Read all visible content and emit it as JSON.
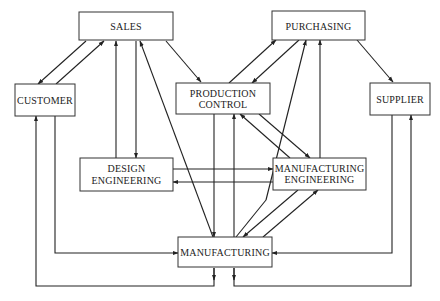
{
  "nodes": {
    "sales": {
      "lines": [
        "SALES"
      ]
    },
    "purchasing": {
      "lines": [
        "PURCHASING"
      ]
    },
    "customer": {
      "lines": [
        "CUSTOMER"
      ]
    },
    "production_control": {
      "lines": [
        "PRODUCTION",
        "CONTROL"
      ]
    },
    "supplier": {
      "lines": [
        "SUPPLIER"
      ]
    },
    "design_engineering": {
      "lines": [
        "DESIGN",
        "ENGINEERING"
      ]
    },
    "manufacturing_engineering": {
      "lines": [
        "MANUFACTURING",
        "ENGINEERING"
      ]
    },
    "manufacturing": {
      "lines": [
        "MANUFACTURING"
      ]
    }
  },
  "edges": [
    {
      "from": "SALES",
      "to": "CUSTOMER"
    },
    {
      "from": "CUSTOMER",
      "to": "SALES"
    },
    {
      "from": "SALES",
      "to": "PRODUCTION CONTROL"
    },
    {
      "from": "DESIGN ENGINEERING",
      "to": "SALES"
    },
    {
      "from": "SALES",
      "to": "DESIGN ENGINEERING"
    },
    {
      "from": "MANUFACTURING",
      "to": "SALES"
    },
    {
      "from": "PRODUCTION CONTROL",
      "to": "PURCHASING"
    },
    {
      "from": "PURCHASING",
      "to": "PRODUCTION CONTROL"
    },
    {
      "from": "MANUFACTURING",
      "to": "PURCHASING"
    },
    {
      "from": "MANUFACTURING ENGINEERING",
      "to": "PURCHASING"
    },
    {
      "from": "PURCHASING",
      "to": "SUPPLIER"
    },
    {
      "from": "PRODUCTION CONTROL",
      "to": "MANUFACTURING"
    },
    {
      "from": "MANUFACTURING",
      "to": "PRODUCTION CONTROL"
    },
    {
      "from": "PRODUCTION CONTROL",
      "to": "MANUFACTURING ENGINEERING"
    },
    {
      "from": "MANUFACTURING ENGINEERING",
      "to": "PRODUCTION CONTROL"
    },
    {
      "from": "DESIGN ENGINEERING",
      "to": "MANUFACTURING ENGINEERING"
    },
    {
      "from": "MANUFACTURING ENGINEERING",
      "to": "DESIGN ENGINEERING"
    },
    {
      "from": "MANUFACTURING ENGINEERING",
      "to": "MANUFACTURING"
    },
    {
      "from": "MANUFACTURING",
      "to": "MANUFACTURING ENGINEERING"
    },
    {
      "from": "CUSTOMER",
      "to": "MANUFACTURING"
    },
    {
      "from": "MANUFACTURING",
      "to": "CUSTOMER"
    },
    {
      "from": "SUPPLIER",
      "to": "MANUFACTURING"
    },
    {
      "from": "MANUFACTURING",
      "to": "SUPPLIER"
    }
  ]
}
